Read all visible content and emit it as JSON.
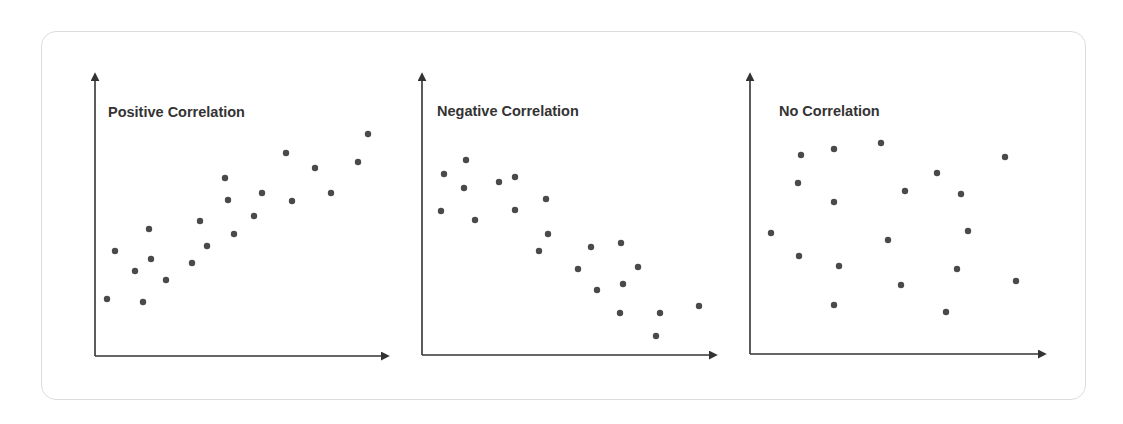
{
  "chart_data": [
    {
      "type": "scatter",
      "title": "Positive Correlation",
      "xlabel": "",
      "ylabel": "",
      "grid": false,
      "axes": {
        "origin": [
          95,
          356
        ],
        "y_top": 72,
        "x_right": 390
      },
      "points_px": [
        [
          107,
          299
        ],
        [
          115,
          251
        ],
        [
          135,
          271
        ],
        [
          143,
          302
        ],
        [
          149,
          229
        ],
        [
          151,
          259
        ],
        [
          166,
          280
        ],
        [
          192,
          263
        ],
        [
          200,
          221
        ],
        [
          207,
          246
        ],
        [
          225,
          178
        ],
        [
          228,
          200
        ],
        [
          234,
          234
        ],
        [
          254,
          216
        ],
        [
          262,
          193
        ],
        [
          286,
          153
        ],
        [
          292,
          201
        ],
        [
          315,
          168
        ],
        [
          331,
          193
        ],
        [
          358,
          162
        ],
        [
          368,
          134
        ]
      ]
    },
    {
      "type": "scatter",
      "title": "Negative Correlation",
      "xlabel": "",
      "ylabel": "",
      "grid": false,
      "axes": {
        "origin": [
          422,
          355
        ],
        "y_top": 72,
        "x_right": 718
      },
      "points_px": [
        [
          444,
          174
        ],
        [
          466,
          160
        ],
        [
          464,
          188
        ],
        [
          441,
          211
        ],
        [
          475,
          220
        ],
        [
          499,
          182
        ],
        [
          515,
          177
        ],
        [
          515,
          210
        ],
        [
          546,
          199
        ],
        [
          548,
          234
        ],
        [
          539,
          251
        ],
        [
          578,
          269
        ],
        [
          591,
          247
        ],
        [
          597,
          290
        ],
        [
          621,
          243
        ],
        [
          638,
          267
        ],
        [
          623,
          284
        ],
        [
          620,
          313
        ],
        [
          660,
          313
        ],
        [
          656,
          336
        ],
        [
          699,
          306
        ]
      ]
    },
    {
      "type": "scatter",
      "title": "No Correlation",
      "xlabel": "",
      "ylabel": "",
      "grid": false,
      "axes": {
        "origin": [
          750,
          354
        ],
        "y_top": 72,
        "x_right": 1047
      },
      "points_px": [
        [
          801,
          155
        ],
        [
          834,
          149
        ],
        [
          881,
          143
        ],
        [
          798,
          183
        ],
        [
          834,
          202
        ],
        [
          771,
          233
        ],
        [
          799,
          256
        ],
        [
          839,
          266
        ],
        [
          834,
          305
        ],
        [
          888,
          240
        ],
        [
          901,
          285
        ],
        [
          905,
          191
        ],
        [
          937,
          173
        ],
        [
          961,
          194
        ],
        [
          968,
          231
        ],
        [
          957,
          269
        ],
        [
          946,
          312
        ],
        [
          1005,
          157
        ],
        [
          1016,
          281
        ]
      ]
    }
  ],
  "panels": [
    {
      "title": "Positive Correlation"
    },
    {
      "title": "Negative Correlation"
    },
    {
      "title": "No Correlation"
    }
  ],
  "colors": {
    "axis": "#333333",
    "dot": "#4a4a4a",
    "title": "#333333",
    "card_border": "#dcdcdc"
  }
}
